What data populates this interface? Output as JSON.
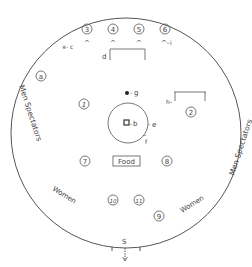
{
  "diagram": {
    "stroke_color": "#444444",
    "zones": {
      "men_left": "Men Spectators",
      "men_right": "Men Spectators",
      "women_left": "Women",
      "women_right": "Women"
    },
    "positions": [
      {
        "id": "1",
        "label": "1"
      },
      {
        "id": "2",
        "label": "2"
      },
      {
        "id": "3",
        "label": "3"
      },
      {
        "id": "4",
        "label": "4"
      },
      {
        "id": "5",
        "label": "5"
      },
      {
        "id": "6",
        "label": "6"
      },
      {
        "id": "7",
        "label": "7"
      },
      {
        "id": "8",
        "label": "8"
      },
      {
        "id": "9",
        "label": "9"
      },
      {
        "id": "10",
        "label": "10"
      },
      {
        "id": "11",
        "label": "11"
      },
      {
        "id": "a",
        "label": "a"
      }
    ],
    "markers": {
      "b": "b",
      "c": "c",
      "d": "d",
      "e": "e",
      "f": "f",
      "g": "g",
      "h": "h",
      "i": "i",
      "s": "S"
    },
    "food_label": "Food"
  }
}
